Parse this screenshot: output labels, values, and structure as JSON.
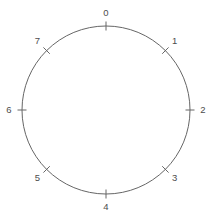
{
  "figure": {
    "title": "",
    "background_color": "#ffffff",
    "width": 212,
    "height": 218
  },
  "chart_data": {
    "type": "scatter",
    "title": "",
    "subtitle": "",
    "xlabel": "",
    "ylabel": "",
    "grid": false,
    "legend": null,
    "shape": "circle",
    "center": [
      106,
      110
    ],
    "radius": 84,
    "stroke_color": "#666666",
    "stroke_width": 1,
    "tick_count": 8,
    "tick_length": 9,
    "tick_color": "#666666",
    "label_color": "#4d4d4d",
    "label_font_size": 9.5,
    "label_offset": 13,
    "categories": [
      "0",
      "1",
      "2",
      "3",
      "4",
      "5",
      "6",
      "7"
    ],
    "values": [
      0,
      1,
      2,
      3,
      4,
      5,
      6,
      7
    ],
    "angles_deg": [
      0,
      45,
      90,
      135,
      180,
      225,
      270,
      315
    ],
    "ticks": [
      {
        "label": "0",
        "angle_deg": 0,
        "position": "top"
      },
      {
        "label": "1",
        "angle_deg": 45,
        "position": "upper-right"
      },
      {
        "label": "2",
        "angle_deg": 90,
        "position": "right"
      },
      {
        "label": "3",
        "angle_deg": 135,
        "position": "lower-right"
      },
      {
        "label": "4",
        "angle_deg": 180,
        "position": "bottom"
      },
      {
        "label": "5",
        "angle_deg": 225,
        "position": "lower-left"
      },
      {
        "label": "6",
        "angle_deg": 270,
        "position": "left"
      },
      {
        "label": "7",
        "angle_deg": 315,
        "position": "upper-left"
      }
    ]
  }
}
